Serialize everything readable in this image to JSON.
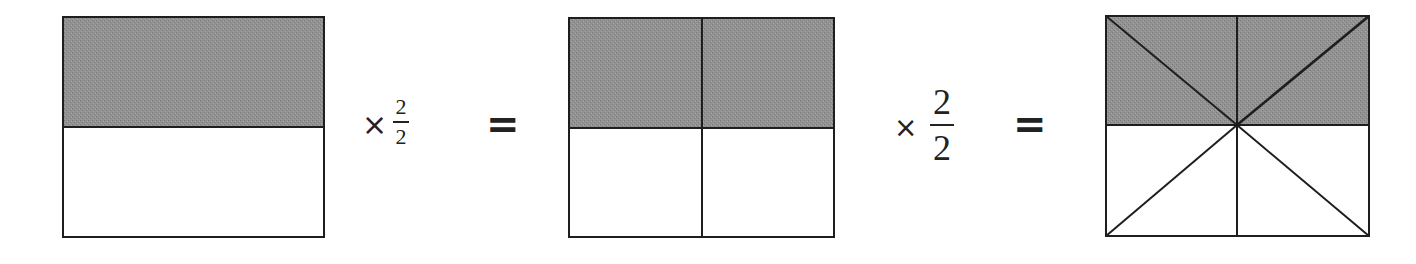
{
  "diagram": {
    "colors": {
      "shade": "#8f8f8f",
      "stroke": "#1e1e1e",
      "background": "#ffffff"
    },
    "panels": [
      {
        "id": "half",
        "parts": 2,
        "shaded": 1,
        "fraction": "1/2"
      },
      {
        "id": "two-quarters",
        "parts": 4,
        "shaded": 2,
        "fraction": "2/4"
      },
      {
        "id": "four-eighths",
        "parts": 8,
        "shaded": 4,
        "fraction": "4/8"
      }
    ],
    "operators": [
      {
        "times": "×",
        "numerator": "2",
        "denominator": "2",
        "equals": "="
      },
      {
        "times": "×",
        "numerator": "2",
        "denominator": "2",
        "equals": "="
      }
    ]
  }
}
